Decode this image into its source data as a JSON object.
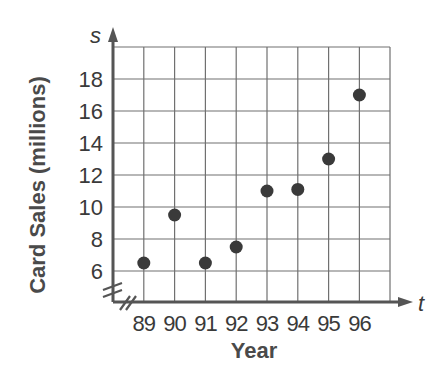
{
  "chart_data": {
    "type": "scatter",
    "title": "",
    "xlabel": "Year",
    "ylabel": "Card Sales (millions)",
    "x_axis_variable": "t",
    "y_axis_variable": "s",
    "x_tick_labels": [
      "89",
      "90",
      "91",
      "92",
      "93",
      "94",
      "95",
      "96"
    ],
    "y_tick_labels": [
      "6",
      "8",
      "10",
      "12",
      "14",
      "16",
      "18"
    ],
    "ylim": [
      4,
      20
    ],
    "y_axis_break": true,
    "x_axis_break": true,
    "grid": true,
    "legend": null,
    "points": [
      {
        "x": "89",
        "y": 6.5
      },
      {
        "x": "90",
        "y": 9.5
      },
      {
        "x": "91",
        "y": 6.5
      },
      {
        "x": "92",
        "y": 7.5
      },
      {
        "x": "93",
        "y": 11
      },
      {
        "x": "94",
        "y": 11.1
      },
      {
        "x": "95",
        "y": 13
      },
      {
        "x": "96",
        "y": 17
      }
    ]
  },
  "labels": {
    "ylabel": "Card Sales (millions)",
    "xlabel": "Year",
    "x_var": "t",
    "y_var": "s"
  },
  "colors": {
    "axis": "#555555",
    "grid": "#707070",
    "point": "#3a3a3a",
    "text": "#3a3a3a"
  }
}
